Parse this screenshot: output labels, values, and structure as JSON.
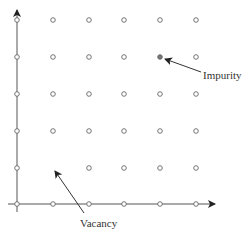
{
  "diagram": {
    "type": "crystal-lattice-point-defects",
    "axes": {
      "origin": [
        17,
        204
      ],
      "x_axis": {
        "from": [
          8,
          204
        ],
        "to": [
          215,
          204
        ]
      },
      "y_axis": {
        "from": [
          17,
          212
        ],
        "to": [
          17,
          10
        ]
      }
    },
    "lattice": {
      "columns_x": [
        17,
        53,
        89,
        124,
        160,
        196
      ],
      "rows_y": [
        20,
        57,
        94,
        131,
        168,
        204
      ],
      "atom_radius": 2.3,
      "atom_stroke": "#666666",
      "atom_fill": "#ffffff"
    },
    "defects": {
      "vacancy": {
        "col": 1,
        "row": 4
      },
      "impurity": {
        "col": 4,
        "row": 1,
        "fill": "#777777"
      }
    },
    "annotations": [
      {
        "id": "impurity",
        "text": "Impurity",
        "text_x": 203,
        "text_y": 79,
        "arrow_from": [
          201,
          72
        ],
        "arrow_to": [
          165,
          59
        ]
      },
      {
        "id": "vacancy",
        "text": "Vacancy",
        "text_x": 80,
        "text_y": 227,
        "arrow_from": [
          84,
          213
        ],
        "arrow_to": [
          55,
          171
        ]
      }
    ]
  },
  "labels": {
    "impurity": "Impurity",
    "vacancy": "Vacancy"
  }
}
